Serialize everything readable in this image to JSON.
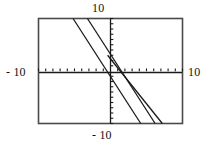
{
  "figure": {
    "kind": "graphing-calculator-screen",
    "frame_color": "#4a4a4a",
    "axis_color": "#1a1a1a",
    "curve_color": "#1a1a1a",
    "background": "#ffffff"
  },
  "labels": {
    "top": "10",
    "bottom": "- 10",
    "left": "- 10",
    "right": "10"
  },
  "chart_data": {
    "type": "line",
    "title": "",
    "xlabel": "",
    "ylabel": "",
    "xlim": [
      -10,
      10
    ],
    "ylim": [
      -10,
      10
    ],
    "grid": false,
    "legend": "none",
    "axes": {
      "x_axis_at_y": 0,
      "y_axis_at_x": 0,
      "x_tick_step": 1,
      "y_tick_step": 1,
      "x_tick_labels": [
        "-10",
        "10"
      ],
      "y_tick_labels": [
        "-10",
        "10"
      ]
    },
    "series": [
      {
        "name": "line-1",
        "x": [
          -5.2,
          4.2
        ],
        "y": [
          10,
          -10
        ],
        "slope": -2.13,
        "intercept": -0.9
      },
      {
        "name": "line-2",
        "x": [
          -3.2,
          6.2
        ],
        "y": [
          10,
          -10
        ],
        "slope": -2.13,
        "intercept": 3.2
      },
      {
        "name": "line-3",
        "x": [
          -0.4,
          7.2
        ],
        "y": [
          3.0,
          -10
        ],
        "slope": -1.71,
        "intercept": 2.3
      }
    ]
  }
}
